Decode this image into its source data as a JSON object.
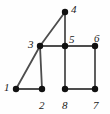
{
  "figure": {
    "kind": "undirected-graph-diagram",
    "width": 110,
    "height": 114,
    "background_color": "#fefefe",
    "edge_color": "#4d4d4d",
    "node_color": "#111111",
    "label_color": "#1a1a1a",
    "node_radius": 3.2,
    "edge_width": 1.8
  },
  "nodes": [
    {
      "id": "1",
      "label": "1",
      "x": 16,
      "y": 89,
      "label_x": 4,
      "label_y": 82
    },
    {
      "id": "2",
      "label": "2",
      "x": 42,
      "y": 89,
      "label_x": 39,
      "label_y": 100
    },
    {
      "id": "3",
      "label": "3",
      "x": 40,
      "y": 46,
      "label_x": 28,
      "label_y": 39
    },
    {
      "id": "4",
      "label": "4",
      "x": 65,
      "y": 12,
      "label_x": 71,
      "label_y": 4
    },
    {
      "id": "5",
      "label": "5",
      "x": 65,
      "y": 46,
      "label_x": 69,
      "label_y": 34
    },
    {
      "id": "6",
      "label": "6",
      "x": 95,
      "y": 46,
      "label_x": 94,
      "label_y": 33
    },
    {
      "id": "7",
      "label": "7",
      "x": 95,
      "y": 89,
      "label_x": 93,
      "label_y": 100
    },
    {
      "id": "8",
      "label": "8",
      "x": 65,
      "y": 89,
      "label_x": 62,
      "label_y": 100
    }
  ],
  "edges": [
    {
      "id": "e-1-2",
      "from": "1",
      "to": "2"
    },
    {
      "id": "e-1-3",
      "from": "1",
      "to": "3"
    },
    {
      "id": "e-3-4",
      "from": "3",
      "to": "4"
    },
    {
      "id": "e-3-2",
      "from": "3",
      "to": "2"
    },
    {
      "id": "e-3-5",
      "from": "3",
      "to": "5"
    },
    {
      "id": "e-4-5",
      "from": "4",
      "to": "5"
    },
    {
      "id": "e-5-6",
      "from": "5",
      "to": "6"
    },
    {
      "id": "e-5-8",
      "from": "5",
      "to": "8"
    },
    {
      "id": "e-6-7",
      "from": "6",
      "to": "7"
    },
    {
      "id": "e-8-7",
      "from": "8",
      "to": "7"
    }
  ]
}
